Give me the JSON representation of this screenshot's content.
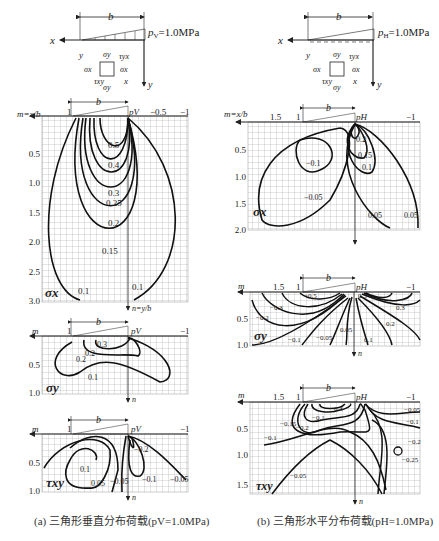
{
  "panel_a": {
    "load_label": "p",
    "load_sub": "V",
    "load_value": "=1.0MPa",
    "b_label": "b",
    "axis_x": "x",
    "axis_y": "y",
    "element_labels": [
      "σy",
      "τyx",
      "σx",
      "σx",
      "τxy",
      "σy"
    ],
    "caption": "(a) 三角形垂直分布荷载(pV=1.0MPa)",
    "sigma_x": {
      "title": "σx",
      "m_axis_label": "m=x/b",
      "n_axis_label": "n=y/b",
      "top_ticks": [
        "1",
        "pV",
        "−0.5",
        "−1"
      ],
      "y_ticks": [
        "0.5",
        "1.0",
        "1.5",
        "2.0",
        "2.5",
        "3.0"
      ],
      "contours": [
        "0.5",
        "0.4",
        "0.3",
        "0.25",
        "0.2",
        "0.15",
        "0.1",
        "0.1"
      ]
    },
    "sigma_y": {
      "title": "σy",
      "m_axis_label": "m",
      "n_axis_label": "n",
      "top_ticks": [
        "1",
        "pV",
        "−1"
      ],
      "y_ticks": [
        "0.5",
        "1.0"
      ],
      "contours": [
        "0.3",
        "0.2",
        "0.2",
        "0.1"
      ]
    },
    "tau_xy": {
      "title": "τxy",
      "m_axis_label": "m",
      "n_axis_label": "n",
      "top_ticks": [
        "1",
        "pV",
        "−1"
      ],
      "y_ticks": [
        "0.5",
        "1.0"
      ],
      "contours": [
        "0.1",
        "0.05",
        "−0.05",
        "−0.2",
        "−0.1",
        "−0.05"
      ]
    }
  },
  "panel_b": {
    "load_label": "p",
    "load_sub": "H",
    "load_value": "=1.0MPa",
    "b_label": "b",
    "axis_x": "x",
    "axis_y": "y",
    "caption": "(b) 三角形水平分布荷载(pH=1.0MPa)",
    "sigma_x": {
      "title": "σx",
      "m_axis_label": "m=x/b",
      "top_ticks": [
        "1.5",
        "1",
        "pH",
        "−1"
      ],
      "y_ticks": [
        "0.5",
        "1.0",
        "1.5",
        "2.0"
      ],
      "contours": [
        "−0.1",
        "−0.05",
        "0.2",
        "0.15",
        "0.1",
        "0.05",
        "0.05"
      ]
    },
    "sigma_y": {
      "title": "σy",
      "m_axis_label": "m",
      "n_axis_label": "n",
      "top_ticks": [
        "1.5",
        "1",
        "pH",
        "−1"
      ],
      "y_ticks": [
        "0.5",
        "1.0"
      ],
      "contours": [
        "−0.5",
        "−0.3",
        "−0.2",
        "−0.1",
        "−0.05",
        "0.05",
        "0.1",
        "0.2",
        "0.3",
        "0.5"
      ]
    },
    "tau_xy": {
      "title": "τxy",
      "m_axis_label": "m",
      "n_axis_label": "n",
      "top_ticks": [
        "1.5",
        "1",
        "pH",
        "−1"
      ],
      "y_ticks": [
        "0.5",
        "1.0",
        "1.5"
      ],
      "contours": [
        "−0.15",
        "−0.2",
        "−0.3",
        "−0.1",
        "−0.1",
        "−0.05",
        "−0.05",
        "−0.1",
        "−0.2",
        "−0.25"
      ]
    }
  }
}
